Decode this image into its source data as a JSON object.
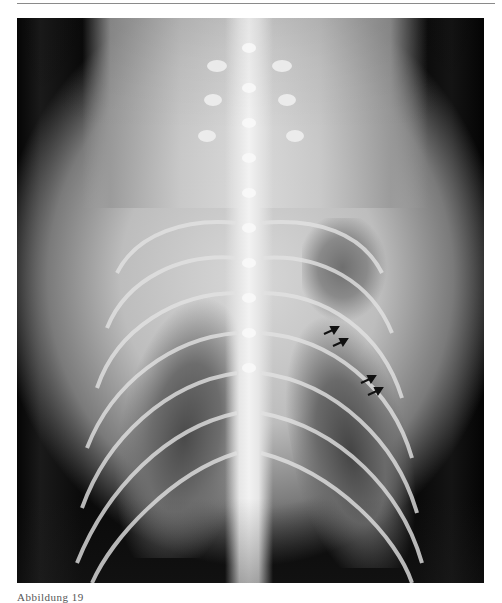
{
  "page": {
    "background": "#ffffff",
    "rule_color": "#8a8a8a"
  },
  "figure": {
    "type": "radiograph",
    "annotations": [
      {
        "kind": "arrow",
        "icon": "arrow-up-right-icon",
        "color": "#111111"
      },
      {
        "kind": "arrow",
        "icon": "arrow-up-right-icon",
        "color": "#111111"
      },
      {
        "kind": "arrow",
        "icon": "arrow-up-right-icon",
        "color": "#111111"
      },
      {
        "kind": "arrow",
        "icon": "arrow-up-right-icon",
        "color": "#111111"
      }
    ]
  },
  "caption": {
    "text": "Abbildung 19"
  }
}
